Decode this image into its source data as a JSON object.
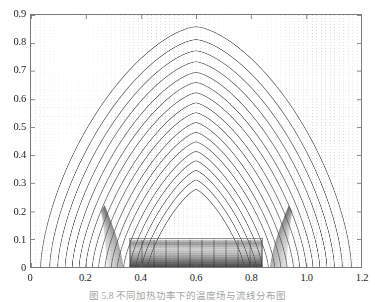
{
  "figure": {
    "caption": "图 5.8  不同加热功率下的温度场与流线分布图",
    "background_color": "#ffffff",
    "frame_color": "#7a7a7a"
  },
  "chart_data": {
    "type": "line",
    "title": "",
    "subtitle": "",
    "xlabel": "",
    "ylabel": "",
    "xlim": [
      0,
      1.2
    ],
    "ylim": [
      0,
      0.9
    ],
    "xticks": [
      0,
      0.2,
      0.4,
      0.6,
      0.8,
      1.0,
      1.2
    ],
    "xtick_labels": [
      "0",
      "0.2",
      "0.4",
      "0.6",
      "0.8",
      "1.0",
      "1.2"
    ],
    "yticks": [
      0,
      0.1,
      0.2,
      0.3,
      0.4,
      0.5,
      0.6,
      0.7,
      0.8,
      0.9
    ],
    "ytick_labels": [
      "0",
      "0.1",
      "0.2",
      "0.3",
      "0.4",
      "0.5",
      "0.6",
      "0.7",
      "0.8",
      "0.9"
    ],
    "grid": true,
    "grid_style": "dotted-vertical-mesh",
    "grid_color": "#d9d9d9",
    "grid_count": 74,
    "legend": [],
    "annotations": [],
    "contour_color": "#4a4a4a",
    "series": [
      {
        "name": "contour-dome-levels",
        "description": "Nested closed contour arcs forming a dome over the domain",
        "type": "contour",
        "n_levels": 17,
        "apex_y_values": [
          0.858,
          0.812,
          0.772,
          0.733,
          0.695,
          0.659,
          0.622,
          0.586,
          0.551,
          0.516,
          0.481,
          0.447,
          0.413,
          0.379,
          0.345,
          0.311,
          0.277
        ],
        "half_width_values": [
          0.565,
          0.532,
          0.503,
          0.476,
          0.45,
          0.425,
          0.401,
          0.377,
          0.354,
          0.331,
          0.308,
          0.286,
          0.263,
          0.241,
          0.219,
          0.197,
          0.175
        ],
        "center_x": 0.6,
        "squareness": [
          0.56,
          0.54,
          0.52,
          0.5,
          0.48,
          0.46,
          0.45,
          0.43,
          0.42,
          0.4,
          0.39,
          0.38,
          0.36,
          0.35,
          0.34,
          0.33,
          0.32
        ]
      },
      {
        "name": "heated-block",
        "description": "Dense dark rectangular source region at domain bottom centre",
        "type": "region",
        "x_range": [
          0.36,
          0.84
        ],
        "y_range": [
          0.0,
          0.103
        ],
        "fill": "dense-grayscale-gradient"
      },
      {
        "name": "plume-shear-layers",
        "description": "Steep near-vertical contour crowding at the block edges",
        "type": "contour",
        "x_positions": [
          0.335,
          0.36,
          0.845,
          0.87
        ],
        "y_range": [
          0.0,
          0.22
        ]
      }
    ]
  }
}
